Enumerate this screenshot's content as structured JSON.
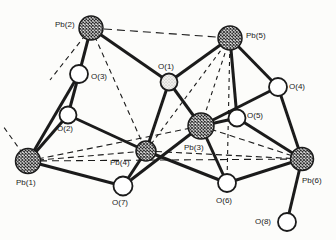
{
  "figure": {
    "kind": "crystal-structure-diagram",
    "background": "#fcfcfa",
    "ink": "#1b1b1b",
    "width": 336,
    "height": 240,
    "bond_width": 3,
    "contact_width": 1.1,
    "atoms": [
      {
        "id": "Pb1",
        "label": "Pb(1)",
        "element": "Pb",
        "x": 28,
        "y": 161,
        "r": 12.5,
        "label_x": 16,
        "label_y": 185
      },
      {
        "id": "Pb2",
        "label": "Pb(2)",
        "element": "Pb",
        "x": 91,
        "y": 28,
        "r": 12,
        "label_x": 55,
        "label_y": 27
      },
      {
        "id": "Pb3",
        "label": "Pb(3)",
        "element": "Pb",
        "x": 201,
        "y": 126,
        "r": 13,
        "label_x": 184,
        "label_y": 150
      },
      {
        "id": "Pb4",
        "label": "Pb(4)",
        "element": "Pb",
        "x": 146,
        "y": 151,
        "r": 10,
        "label_x": 110,
        "label_y": 165
      },
      {
        "id": "Pb5",
        "label": "Pb(5)",
        "element": "Pb",
        "x": 230,
        "y": 38,
        "r": 12,
        "label_x": 246,
        "label_y": 38
      },
      {
        "id": "Pb6",
        "label": "Pb(6)",
        "element": "Pb",
        "x": 302,
        "y": 159,
        "r": 11.5,
        "label_x": 302,
        "label_y": 183
      },
      {
        "id": "O1",
        "label": "O(1)",
        "element": "O",
        "x": 169,
        "y": 82,
        "r": 8.5,
        "textured": true,
        "label_x": 158,
        "label_y": 69
      },
      {
        "id": "O2",
        "label": "O(2)",
        "element": "O",
        "x": 68,
        "y": 115,
        "r": 8.5,
        "label_x": 57,
        "label_y": 131
      },
      {
        "id": "O3",
        "label": "O(3)",
        "element": "O",
        "x": 79,
        "y": 74,
        "r": 9,
        "label_x": 91,
        "label_y": 79
      },
      {
        "id": "O4",
        "label": "O(4)",
        "element": "O",
        "x": 278,
        "y": 87,
        "r": 9,
        "label_x": 289,
        "label_y": 89
      },
      {
        "id": "O5",
        "label": "O(5)",
        "element": "O",
        "x": 237,
        "y": 118,
        "r": 8.5,
        "label_x": 247,
        "label_y": 118
      },
      {
        "id": "O6",
        "label": "O(6)",
        "element": "O",
        "x": 227,
        "y": 183,
        "r": 9,
        "label_x": 216,
        "label_y": 203
      },
      {
        "id": "O7",
        "label": "O(7)",
        "element": "O",
        "x": 123,
        "y": 186,
        "r": 9.5,
        "label_x": 112,
        "label_y": 205
      },
      {
        "id": "O8",
        "label": "O(8)",
        "element": "O",
        "x": 287,
        "y": 222,
        "r": 9,
        "label_x": 255,
        "label_y": 224
      }
    ],
    "bonds": [
      [
        "Pb2",
        "O3"
      ],
      [
        "O3",
        "O2"
      ],
      [
        "Pb2",
        "O1"
      ],
      [
        "Pb5",
        "O1"
      ],
      [
        "Pb5",
        "O5"
      ],
      [
        "Pb5",
        "O4"
      ],
      [
        "Pb1",
        "O2"
      ],
      [
        "Pb1",
        "O3"
      ],
      [
        "Pb1",
        "O7"
      ],
      [
        "O2",
        "Pb4"
      ],
      [
        "O7",
        "Pb4"
      ],
      [
        "O7",
        "Pb3"
      ],
      [
        "O1",
        "Pb4"
      ],
      [
        "O1",
        "Pb3"
      ],
      [
        "Pb3",
        "O4"
      ],
      [
        "Pb3",
        "O5"
      ],
      [
        "Pb3",
        "O6"
      ],
      [
        "Pb4",
        "O6"
      ],
      [
        "O6",
        "Pb6"
      ],
      [
        "O5",
        "Pb6"
      ],
      [
        "O4",
        "Pb6"
      ],
      [
        "Pb6",
        "O8"
      ]
    ],
    "contacts": [
      {
        "a": "Pb2",
        "b": "Pb5",
        "dash": "8,5"
      },
      {
        "a": "Pb2",
        "b": "Pb4",
        "dash": "5,4"
      },
      {
        "a": "Pb1",
        "b": "Pb4",
        "dash": "6,4"
      },
      {
        "a": "Pb1",
        "b": "Pb3",
        "dash": "6,4"
      },
      {
        "a": "Pb1",
        "b": "Pb6",
        "dash": "7,5"
      },
      {
        "a": "Pb5",
        "b": "Pb4",
        "dash": "4,4"
      },
      {
        "a": "Pb5",
        "b": "Pb3",
        "dash": "4,4"
      },
      {
        "a": "Pb5",
        "b": "O6",
        "dash": "4,4"
      },
      {
        "a": "Pb3",
        "b": "Pb6",
        "dash": "6,4"
      },
      {
        "a": "Pb4",
        "b": "Pb6",
        "dash": "6,4"
      },
      {
        "a": "Pb1",
        "x2": 3,
        "y2": 126,
        "dash": "5,4"
      },
      {
        "a": "Pb2",
        "x2": 50,
        "y2": 80,
        "dash": "5,4"
      }
    ]
  }
}
